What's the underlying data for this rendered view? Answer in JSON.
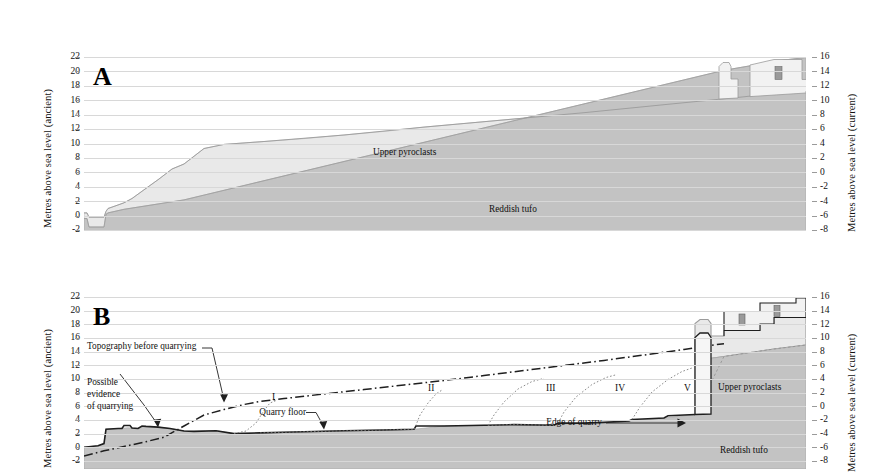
{
  "figure": {
    "axis_left_title": "Metres above sea level (ancient)",
    "axis_right_title": "Metres above sea level (current)",
    "left_ticks": [
      "22",
      "20",
      "18",
      "16",
      "14",
      "12",
      "10",
      "8",
      "6",
      "4",
      "2",
      "0",
      "-2"
    ],
    "right_ticks": [
      "16",
      "14",
      "12",
      "10",
      "8",
      "6",
      "4",
      "2",
      "0",
      "-2",
      "-4",
      "-6",
      "-8"
    ],
    "colors": {
      "upper_pyroclasts": "#e9e9e9",
      "reddish_tufo": "#c3c3c3",
      "building_fill": "#f2f2f2",
      "window_fill": "#9a9a9a",
      "gridline": "#d8d8d8",
      "outline": "#1a1a1a"
    }
  },
  "panel_a": {
    "letter": "A",
    "strata": [
      {
        "name": "Upper pyroclasts",
        "label": "Upper pyroclasts"
      },
      {
        "name": "Reddish tufo",
        "label": "Reddish tufo"
      }
    ]
  },
  "panel_b": {
    "letter": "B",
    "strata": [
      {
        "name": "Upper pyroclasts",
        "label": "Upper pyroclasts"
      },
      {
        "name": "Reddish tufo",
        "label": "Reddish tufo"
      }
    ],
    "annotations": {
      "topography": "Topography before quarrying",
      "possible_evidence_l1": "Possible",
      "possible_evidence_l2": "evidence",
      "possible_evidence_l3": "of quarrying",
      "quarry_floor": "Quarry floor",
      "edge_of_quarry": "Edge of quarry"
    },
    "quarry_stages": [
      "I",
      "II",
      "III",
      "IV",
      "V"
    ]
  },
  "chart_data": {
    "type": "area",
    "ylabel_left": "Metres above sea level (ancient)",
    "ylabel_right": "Metres above sea level (current)",
    "ylim_left": [
      -2,
      22
    ],
    "ylim_right": [
      -8,
      16
    ],
    "grid": true,
    "offset_left_minus_right": 6,
    "panels": [
      {
        "id": "A",
        "series": [
          {
            "name": "Ground surface (top of Upper pyroclasts)",
            "x": [
              0,
              3,
              5,
              20,
              22,
              24,
              28,
              30,
              34,
              40,
              48,
              60,
              100,
              140,
              180,
              220,
              260,
              300,
              340,
              380,
              420,
              460,
              500,
              540,
              580,
              620,
              660,
              700,
              722
            ],
            "y": [
              0.4,
              0.4,
              -0.2,
              -0.2,
              0.6,
              1.0,
              1.2,
              1.3,
              1.5,
              1.8,
              2.4,
              3.6,
              7.0,
              9.7,
              10.2,
              10.6,
              11.1,
              11.6,
              12.2,
              12.7,
              13.2,
              13.7,
              14.2,
              14.8,
              15.3,
              15.8,
              16.4,
              17.0,
              17.4
            ]
          },
          {
            "name": "Top of Reddish tufo",
            "x": [
              0,
              3,
              5,
              20,
              22,
              24,
              40,
              100,
              200,
              300,
              400,
              500,
              600,
              700,
              722
            ],
            "y": [
              -0.4,
              -0.4,
              -1.6,
              -1.6,
              0.2,
              0.4,
              0.9,
              2.2,
              4.3,
              6.4,
              8.4,
              10.5,
              12.5,
              14.6,
              15.0
            ]
          }
        ],
        "structures": [
          {
            "name": "tower",
            "x": 637,
            "base_y": 16.1,
            "top_y": 20.6,
            "width": 12
          },
          {
            "name": "building-with-window",
            "x": 666,
            "base_y": 16.6,
            "top_y": 21.6,
            "width": 52
          }
        ]
      },
      {
        "id": "B",
        "series": [
          {
            "name": "Topography before quarrying (dash-dot)",
            "x": [
              0,
              20,
              40,
              60,
              80,
              110,
              140,
              170,
              200,
              240,
              300,
              360,
              420,
              480,
              540,
              600,
              640,
              660
            ],
            "y": [
              -1.6,
              -0.9,
              -0.3,
              0.3,
              1.0,
              2.6,
              4.9,
              6.7,
              7.4,
              8.2,
              9.6,
              11.0,
              12.4,
              13.8,
              15.3,
              16.8,
              17.7,
              18.1
            ]
          },
          {
            "name": "Quarry floor (current excavated surface)",
            "x": [
              0,
              14,
              20,
              34,
              44,
              54,
              62,
              74,
              86,
              110,
              132,
              150,
              176,
              230,
              260,
              300,
              330,
              372,
              420,
              470,
              520,
              560,
              600,
              640,
              660
            ],
            "y": [
              -1.9,
              -1.7,
              -1.4,
              0.6,
              0.7,
              0.6,
              0.9,
              0.8,
              0.6,
              0.2,
              0.3,
              -0.1,
              0.0,
              0.1,
              0.2,
              0.3,
              0.4,
              0.6,
              1.0,
              0.9,
              1.2,
              1.5,
              1.7,
              1.9,
              2.1
            ]
          },
          {
            "name": "Quarry extraction faces (dotted, stages I-V)",
            "stages": [
              {
                "label": "I",
                "x_label": 188,
                "x_base": 176,
                "y_top": 7.6
              },
              {
                "label": "II",
                "x_label": 344,
                "x_base": 330,
                "y_top": 10.8
              },
              {
                "label": "III",
                "x_label": 462,
                "x_base": 430,
                "y_top": 12.6
              },
              {
                "label": "IV",
                "x_label": 531,
                "x_base": 510,
                "y_top": 14.0
              },
              {
                "label": "V",
                "x_label": 600,
                "x_base": 590,
                "y_top": 16.2
              }
            ]
          },
          {
            "name": "Top of Reddish tufo",
            "x": [
              0,
              100,
              200,
              300,
              400,
              500,
              600,
              660,
              722
            ],
            "y": [
              -2.0,
              1.1,
              3.2,
              5.3,
              7.3,
              9.4,
              11.4,
              12.7,
              14.0
            ]
          }
        ],
        "structures": [
          {
            "name": "pillar",
            "x": 618,
            "base_y": 2.4,
            "top_y": 19.8,
            "width": 14
          },
          {
            "name": "building-window-left",
            "x": 662,
            "base_y": 17.8,
            "top_y": 21.2,
            "width": 38
          },
          {
            "name": "building-window-right",
            "x": 700,
            "base_y": 18.6,
            "top_y": 22.2,
            "width": 30
          }
        ]
      }
    ]
  }
}
